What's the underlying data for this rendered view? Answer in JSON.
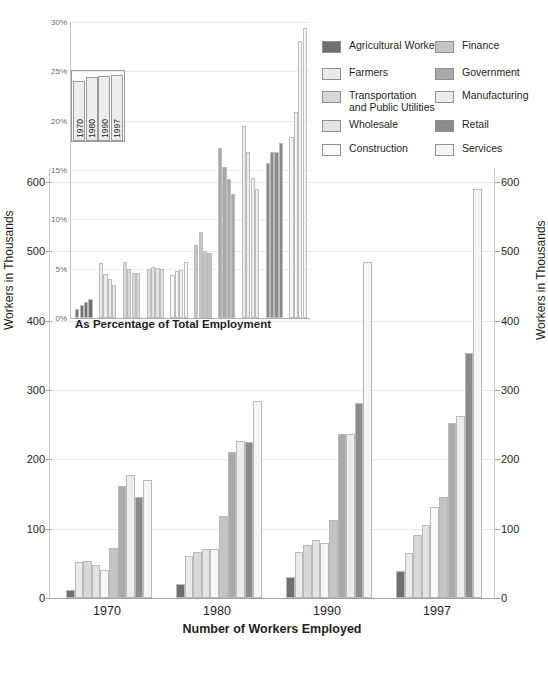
{
  "chart_data": {
    "type": "bar",
    "title": "",
    "main": {
      "type": "bar",
      "xlabel": "Number of Workers Employed",
      "ylabel": "Workers in Thousands",
      "ylabel_right": "Workers in Thousands",
      "ylim": [
        0,
        620
      ],
      "yticks": [
        0,
        100,
        200,
        300,
        400,
        500,
        600
      ],
      "ytick_labels": [
        "0",
        "100",
        "200",
        "300",
        "400",
        "500",
        "600"
      ],
      "grid": true,
      "categories": [
        "1970",
        "1980",
        "1990",
        "1997"
      ],
      "series": [
        {
          "name": "Agricultural Workers",
          "color": "#6f6f6f",
          "values": [
            11,
            20,
            30,
            39
          ]
        },
        {
          "name": "Farmers",
          "color": "#eaeaea",
          "values": [
            52,
            61,
            66,
            65
          ]
        },
        {
          "name": "Transportation and Public Utilities",
          "color": "#d8d8d8",
          "values": [
            54,
            66,
            76,
            91
          ]
        },
        {
          "name": "Wholesale",
          "color": "#e3e3e3",
          "values": [
            48,
            71,
            83,
            105
          ]
        },
        {
          "name": "Construction",
          "color": "#f7f7f7",
          "values": [
            41,
            70,
            80,
            131
          ]
        },
        {
          "name": "Finance",
          "color": "#c4c4c4",
          "values": [
            72,
            118,
            113,
            145
          ]
        },
        {
          "name": "Government",
          "color": "#a9a9a9",
          "values": [
            161,
            210,
            237,
            253
          ]
        },
        {
          "name": "Manufacturing",
          "color": "#ececec",
          "values": [
            178,
            227,
            237,
            262
          ]
        },
        {
          "name": "Retail",
          "color": "#8b8b8b",
          "values": [
            146,
            225,
            281,
            353
          ]
        },
        {
          "name": "Services",
          "color": "#f5f5f5",
          "values": [
            170,
            284,
            484,
            590
          ]
        }
      ]
    },
    "inset": {
      "type": "bar",
      "title": "As Percentage of Total Employment",
      "ylim": [
        0,
        30
      ],
      "yticks": [
        0,
        5,
        10,
        15,
        20,
        25,
        30
      ],
      "ytick_labels": [
        "0%",
        "5%",
        "10%",
        "15%",
        "20%",
        "25%",
        "30%"
      ],
      "grid": true,
      "year_key": {
        "years": [
          "1970",
          "1980",
          "1990",
          "1997"
        ],
        "heights": [
          23.1,
          24.6,
          25.2,
          25.6
        ]
      },
      "groups": [
        {
          "name": "Agricultural Workers",
          "color": "#6f6f6f",
          "values": [
            0.9,
            1.3,
            1.6,
            1.9
          ]
        },
        {
          "name": "Farmers",
          "color": "#eaeaea",
          "values": [
            5.6,
            4.5,
            4.0,
            3.3
          ]
        },
        {
          "name": "Transportation and Public Utilities",
          "color": "#d8d8d8",
          "values": [
            5.7,
            5.0,
            4.6,
            4.6
          ]
        },
        {
          "name": "Wholesale",
          "color": "#e3e3e3",
          "values": [
            5.0,
            5.2,
            5.1,
            5.0
          ]
        },
        {
          "name": "Construction",
          "color": "#f7f7f7",
          "values": [
            4.4,
            4.8,
            4.9,
            5.7
          ]
        },
        {
          "name": "Finance",
          "color": "#c4c4c4",
          "values": [
            7.4,
            8.7,
            6.8,
            6.6
          ]
        },
        {
          "name": "Government",
          "color": "#a9a9a9",
          "values": [
            17.2,
            15.3,
            14.1,
            12.6
          ]
        },
        {
          "name": "Manufacturing",
          "color": "#ececec",
          "values": [
            19.5,
            16.8,
            14.2,
            13.1
          ]
        },
        {
          "name": "Retail",
          "color": "#8b8b8b",
          "values": [
            15.7,
            16.8,
            16.8,
            17.7
          ]
        },
        {
          "name": "Services",
          "color": "#f5f5f5",
          "values": [
            18.3,
            20.9,
            28.1,
            29.4
          ]
        }
      ]
    },
    "legend": {
      "position": "top-right",
      "columns": 2,
      "entries": [
        {
          "label": "Agricultural Workers",
          "color": "#6f6f6f"
        },
        {
          "label": "Finance",
          "color": "#c4c4c4"
        },
        {
          "label": "Farmers",
          "color": "#eaeaea"
        },
        {
          "label": "Government",
          "color": "#a9a9a9"
        },
        {
          "label": "Transportation\nand Public Utilities",
          "color": "#d8d8d8"
        },
        {
          "label": "Manufacturing",
          "color": "#ececec"
        },
        {
          "label": "Wholesale",
          "color": "#e3e3e3"
        },
        {
          "label": "Retail",
          "color": "#8b8b8b"
        },
        {
          "label": "Construction",
          "color": "#fbfbfb"
        },
        {
          "label": "Services",
          "color": "#f5f5f5"
        }
      ]
    }
  },
  "labels": {
    "main_ylabel_left": "Workers in Thousands",
    "main_ylabel_right": "Workers in Thousands",
    "main_xtitle": "Number of Workers Employed",
    "inset_title": "As Percentage of Total Employment"
  }
}
